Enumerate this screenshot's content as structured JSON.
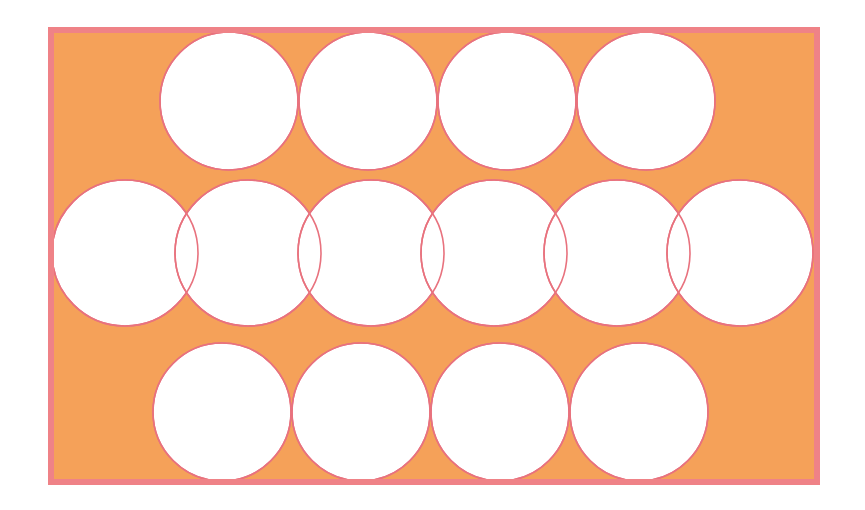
{
  "figure": {
    "title": "Circle packing diagram",
    "canvas": {
      "width": 865,
      "height": 510,
      "background": "#ffffff"
    },
    "panel": {
      "x": 48,
      "y": 27,
      "width": 772,
      "height": 458,
      "fill": "#f5a159",
      "stroke": "#ef8287",
      "stroke_width": 6
    },
    "circle_style": {
      "fill": "#ffffff",
      "stroke": "#e8727e",
      "stroke_width": 1.6
    },
    "rows": [
      {
        "name": "top-row",
        "count": 4,
        "radius": 69,
        "cy": 101,
        "overlap": "tangent",
        "centers_x": [
          229,
          368,
          507,
          646
        ]
      },
      {
        "name": "middle-row",
        "count": 6,
        "radius": 73,
        "cy": 253,
        "overlap": "overlapping",
        "centers_x": [
          125,
          248,
          371,
          494,
          617,
          740
        ]
      },
      {
        "name": "bottom-row",
        "count": 4,
        "radius": 69,
        "cy": 412,
        "overlap": "tangent",
        "centers_x": [
          222,
          361,
          500,
          639
        ]
      }
    ],
    "counts": {
      "total_circles": 14,
      "top_row_circles": 4,
      "middle_row_circles": 6,
      "bottom_row_circles": 4,
      "lens_overlaps": 5
    },
    "colors": {
      "orange_fill": "#f5a159",
      "pink_border": "#ef8287",
      "circle_outline": "#e8727e",
      "circle_fill": "#ffffff",
      "page_background": "#ffffff"
    }
  }
}
